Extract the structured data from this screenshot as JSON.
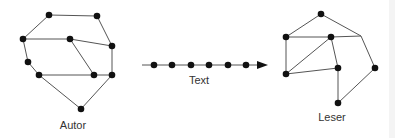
{
  "labels": {
    "author": "Autor",
    "text": "Text",
    "reader": "Leser"
  },
  "colors": {
    "node": "#111111",
    "edge": "#555555",
    "label": "#333333"
  },
  "author_graph": {
    "nodes": [
      [
        49,
        15
      ],
      [
        97,
        16
      ],
      [
        23,
        39
      ],
      [
        70,
        39
      ],
      [
        112,
        46
      ],
      [
        28,
        62
      ],
      [
        39,
        75
      ],
      [
        94,
        75
      ],
      [
        112,
        75
      ],
      [
        81,
        109
      ]
    ],
    "edges": [
      [
        0,
        1
      ],
      [
        1,
        4
      ],
      [
        0,
        2
      ],
      [
        2,
        3
      ],
      [
        3,
        4
      ],
      [
        3,
        7
      ],
      [
        4,
        8
      ],
      [
        2,
        5
      ],
      [
        5,
        6
      ],
      [
        6,
        7
      ],
      [
        7,
        8
      ],
      [
        6,
        9
      ],
      [
        8,
        9
      ]
    ]
  },
  "text_chain": {
    "dots_x": [
      154,
      172,
      191,
      209,
      228,
      246
    ],
    "y": 65,
    "x_start": 142,
    "x_end": 268
  },
  "reader_graph": {
    "nodes": [
      [
        321,
        14
      ],
      [
        286,
        37
      ],
      [
        331,
        37
      ],
      [
        286,
        74
      ],
      [
        338,
        68
      ],
      [
        375,
        68
      ],
      [
        338,
        103
      ]
    ],
    "bend": [
      361,
      36
    ],
    "edges": [
      [
        0,
        1
      ],
      [
        1,
        2
      ],
      [
        1,
        3
      ],
      [
        2,
        3
      ],
      [
        2,
        4
      ],
      [
        3,
        4
      ],
      [
        4,
        6
      ],
      [
        5,
        6
      ]
    ]
  }
}
